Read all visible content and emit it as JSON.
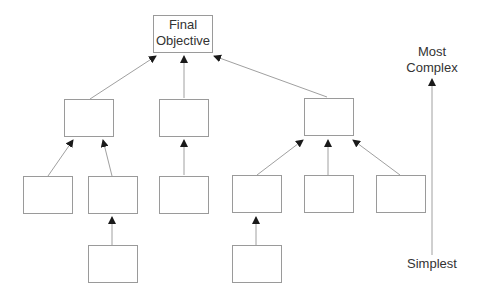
{
  "diagram": {
    "root": {
      "label_line1": "Final",
      "label_line2": "Objective"
    },
    "axis": {
      "top_line1": "Most",
      "top_line2": "Complex",
      "bottom": "Simplest"
    },
    "colors": {
      "line": "#9a9a9a",
      "arrowhead": "#1a1a1a",
      "text": "#333333"
    }
  }
}
